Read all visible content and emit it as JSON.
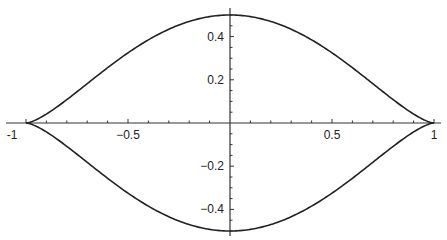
{
  "chart_data": {
    "type": "line",
    "title": "",
    "xlabel": "",
    "ylabel": "",
    "xlim": [
      -1,
      1
    ],
    "ylim": [
      -0.5,
      0.5
    ],
    "grid": false,
    "legend": null,
    "x_ticks": [
      {
        "value": -1,
        "label": "-1"
      },
      {
        "value": -0.5,
        "label": "−0.5"
      },
      {
        "value": 0.5,
        "label": "0.5"
      },
      {
        "value": 1,
        "label": "1"
      }
    ],
    "y_ticks": [
      {
        "value": 0.4,
        "label": "0.4"
      },
      {
        "value": 0.2,
        "label": "0.2"
      },
      {
        "value": -0.2,
        "label": "−0.2"
      },
      {
        "value": -0.4,
        "label": "−0.4"
      }
    ],
    "series": [
      {
        "name": "upper",
        "x": [
          -1,
          -0.9,
          -0.8,
          -0.7,
          -0.6,
          -0.5,
          -0.4,
          -0.3,
          -0.2,
          -0.1,
          0,
          0.1,
          0.2,
          0.3,
          0.4,
          0.5,
          0.6,
          0.7,
          0.8,
          0.9,
          1
        ],
        "y": [
          0,
          0.041,
          0.108,
          0.182,
          0.256,
          0.325,
          0.385,
          0.434,
          0.47,
          0.493,
          0.5,
          0.493,
          0.47,
          0.434,
          0.385,
          0.325,
          0.256,
          0.182,
          0.108,
          0.041,
          0
        ]
      },
      {
        "name": "lower",
        "x": [
          -1,
          -0.9,
          -0.8,
          -0.7,
          -0.6,
          -0.5,
          -0.4,
          -0.3,
          -0.2,
          -0.1,
          0,
          0.1,
          0.2,
          0.3,
          0.4,
          0.5,
          0.6,
          0.7,
          0.8,
          0.9,
          1
        ],
        "y": [
          0,
          -0.041,
          -0.108,
          -0.182,
          -0.256,
          -0.325,
          -0.385,
          -0.434,
          -0.47,
          -0.493,
          -0.5,
          -0.493,
          -0.47,
          -0.434,
          -0.385,
          -0.325,
          -0.256,
          -0.182,
          -0.108,
          -0.041,
          0
        ]
      }
    ]
  },
  "style": {
    "line_color": "#222222",
    "axis_color": "#333333",
    "background": "#ffffff"
  }
}
